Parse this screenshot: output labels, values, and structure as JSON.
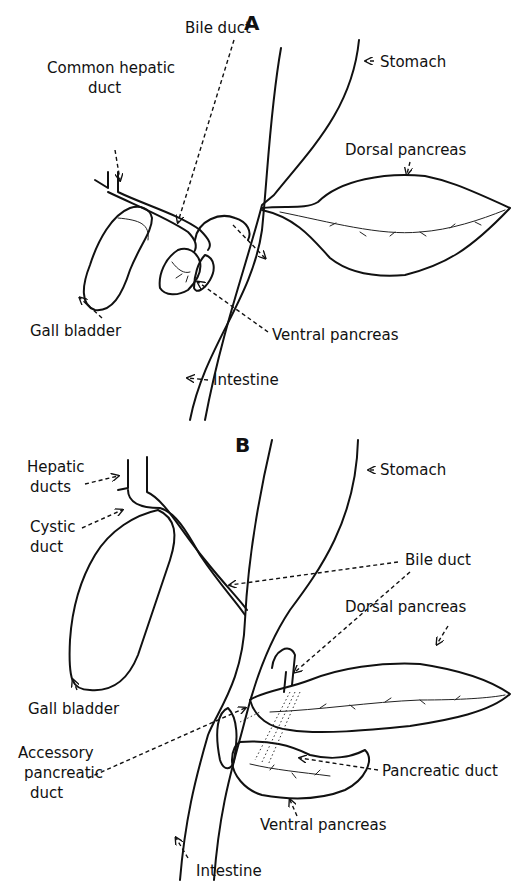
{
  "figure": {
    "panel_a": {
      "letter": "A",
      "labels": {
        "bile_duct": "Bile duct",
        "common_hepatic_1": "Common hepatic",
        "common_hepatic_2": "duct",
        "stomach": "Stomach",
        "dorsal_pancreas": "Dorsal pancreas",
        "gall_bladder": "Gall bladder",
        "ventral_pancreas": "Ventral pancreas",
        "intestine": "Intestine"
      }
    },
    "panel_b": {
      "letter": "B",
      "labels": {
        "hepatic_1": "Hepatic",
        "hepatic_2": "ducts",
        "cystic_1": "Cystic",
        "cystic_2": "duct",
        "stomach": "Stomach",
        "bile_duct": "Bile duct",
        "dorsal_pancreas": "Dorsal pancreas",
        "gall_bladder": "Gall bladder",
        "accessory_1": "Accessory",
        "accessory_2": "pancreatic",
        "accessory_3": "duct",
        "pancreatic_duct": "Pancreatic duct",
        "ventral_pancreas": "Ventral pancreas",
        "intestine": "Intestine"
      }
    }
  }
}
